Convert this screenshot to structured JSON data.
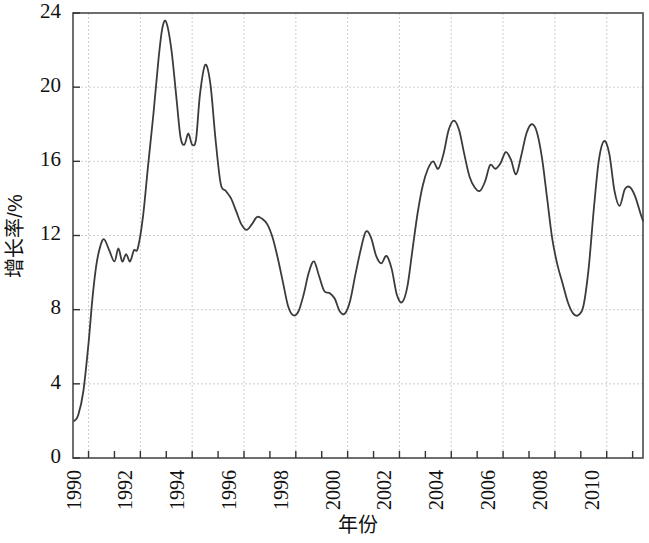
{
  "chart_data": {
    "type": "line",
    "title": "",
    "xlabel": "年份",
    "ylabel": "增长率/%",
    "xlim": [
      1989.4,
      2011.4
    ],
    "ylim": [
      0,
      24
    ],
    "grid": true,
    "legend": null,
    "y_ticks": [
      0,
      4,
      8,
      12,
      16,
      20,
      24
    ],
    "y_tick_labels": [
      "0",
      "4",
      "8",
      "12",
      "16",
      "20",
      "24"
    ],
    "x_ticks": [
      1990,
      1991,
      1992,
      1993,
      1994,
      1995,
      1996,
      1997,
      1998,
      1999,
      2000,
      2001,
      2002,
      2003,
      2004,
      2005,
      2006,
      2007,
      2008,
      2009,
      2010,
      2011
    ],
    "x_tick_labels": [
      "1990",
      "",
      "1992",
      "",
      "1994",
      "",
      "1996",
      "",
      "1998",
      "",
      "2000",
      "",
      "2002",
      "",
      "2004",
      "",
      "2006",
      "",
      "2008",
      "",
      "2010",
      ""
    ],
    "series": [
      {
        "name": "增长率",
        "color": "#3b3b3b",
        "x": [
          1989.45,
          1989.6,
          1989.8,
          1990.0,
          1990.15,
          1990.3,
          1990.45,
          1990.6,
          1990.8,
          1991.0,
          1991.15,
          1991.3,
          1991.45,
          1991.6,
          1991.75,
          1991.9,
          1992.1,
          1992.3,
          1992.5,
          1992.7,
          1992.85,
          1993.0,
          1993.2,
          1993.4,
          1993.55,
          1993.7,
          1993.85,
          1994.0,
          1994.15,
          1994.3,
          1994.5,
          1994.7,
          1994.9,
          1995.1,
          1995.3,
          1995.5,
          1995.7,
          1995.9,
          1996.1,
          1996.3,
          1996.5,
          1996.7,
          1996.9,
          1997.1,
          1997.3,
          1997.5,
          1997.7,
          1997.9,
          1998.1,
          1998.3,
          1998.5,
          1998.7,
          1998.9,
          1999.1,
          1999.3,
          1999.5,
          1999.7,
          1999.9,
          2000.1,
          2000.3,
          2000.5,
          2000.7,
          2000.9,
          2001.1,
          2001.3,
          2001.5,
          2001.7,
          2001.9,
          2002.1,
          2002.3,
          2002.5,
          2002.7,
          2002.9,
          2003.1,
          2003.3,
          2003.5,
          2003.7,
          2003.9,
          2004.1,
          2004.3,
          2004.5,
          2004.7,
          2004.9,
          2005.1,
          2005.3,
          2005.5,
          2005.7,
          2005.9,
          2006.1,
          2006.3,
          2006.5,
          2006.7,
          2006.9,
          2007.1,
          2007.3,
          2007.5,
          2007.7,
          2007.9,
          2008.1,
          2008.3,
          2008.5,
          2008.7,
          2008.9,
          2009.1,
          2009.3,
          2009.5,
          2009.7,
          2009.9,
          2010.1,
          2010.3,
          2010.5,
          2010.7,
          2010.9,
          2011.1,
          2011.3,
          2011.4
        ],
        "y": [
          2.0,
          2.3,
          3.6,
          6.2,
          8.6,
          10.4,
          11.4,
          11.8,
          11.2,
          10.6,
          11.3,
          10.6,
          11.0,
          10.6,
          11.2,
          11.3,
          13.0,
          15.8,
          18.5,
          21.5,
          23.2,
          23.5,
          22.0,
          19.3,
          17.3,
          16.9,
          17.5,
          16.9,
          17.2,
          19.6,
          21.2,
          20.2,
          17.2,
          14.8,
          14.4,
          14.0,
          13.3,
          12.6,
          12.3,
          12.6,
          13.0,
          12.9,
          12.6,
          11.9,
          10.8,
          9.5,
          8.2,
          7.7,
          7.9,
          8.8,
          10.0,
          10.6,
          9.8,
          9.0,
          8.9,
          8.6,
          7.9,
          7.8,
          8.5,
          9.9,
          11.2,
          12.2,
          11.9,
          10.9,
          10.5,
          10.9,
          10.2,
          8.8,
          8.4,
          9.2,
          11.2,
          13.2,
          14.7,
          15.6,
          16.0,
          15.6,
          16.4,
          17.7,
          18.2,
          17.7,
          16.4,
          15.2,
          14.6,
          14.4,
          14.9,
          15.8,
          15.6,
          15.9,
          16.5,
          16.1,
          15.3,
          16.3,
          17.5,
          18.0,
          17.6,
          16.2,
          14.0,
          11.8,
          10.4,
          9.4,
          8.4,
          7.8,
          7.7,
          8.2,
          10.2,
          13.4,
          16.1,
          17.1,
          16.4,
          14.4,
          13.6,
          14.5,
          14.6,
          14.1,
          13.2,
          12.8
        ]
      }
    ]
  },
  "plot_geometry": {
    "left": 73,
    "right": 643,
    "top": 13,
    "bottom": 458
  }
}
